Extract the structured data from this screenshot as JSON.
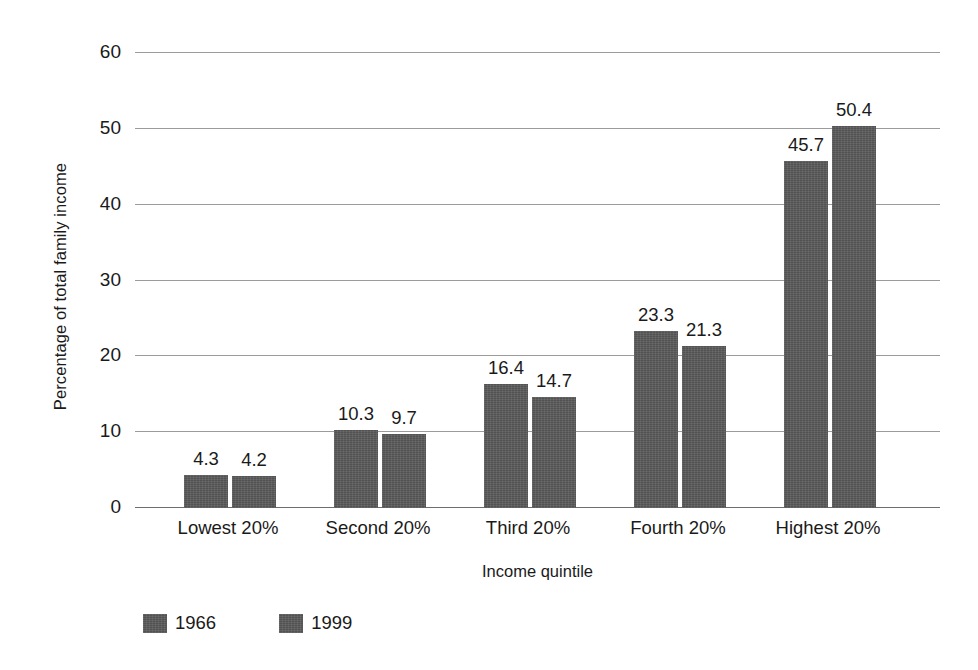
{
  "chart_data": {
    "type": "bar",
    "title": "",
    "xlabel": "Income quintile",
    "ylabel": "Percentage of total family income",
    "categories": [
      "Lowest 20%",
      "Second 20%",
      "Third 20%",
      "Fourth 20%",
      "Highest 20%"
    ],
    "series": [
      {
        "name": "1966",
        "values": [
          4.3,
          10.3,
          16.4,
          23.3,
          45.7
        ]
      },
      {
        "name": "1999",
        "values": [
          4.2,
          9.7,
          14.7,
          21.3,
          50.4
        ]
      }
    ],
    "ylim": [
      0,
      60
    ],
    "yticks": [
      0,
      10,
      20,
      30,
      40,
      50,
      60
    ],
    "ytick_labels": [
      "0",
      "10",
      "20",
      "30",
      "40",
      "50",
      "60"
    ],
    "grid": true,
    "legend_position": "bottom-left",
    "bar_color": "#5a5a5a",
    "grid_color": "#9b9b9b",
    "axis_color": "#6e6e6e",
    "text_color": "#1a1a1a",
    "background": "#ffffff"
  }
}
